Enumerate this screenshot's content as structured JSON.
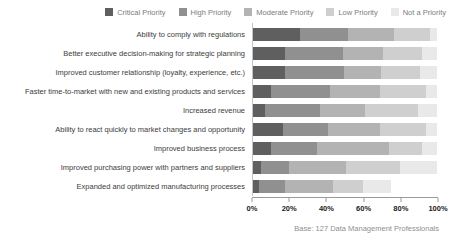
{
  "chart_data": {
    "type": "bar",
    "stacked": true,
    "orientation": "horizontal",
    "unit": "%",
    "categories": [
      "Ability to comply with regulations",
      "Better executive decision-making for strategic planning",
      "Improved customer relationship (loyalty, experience, etc.)",
      "Faster time-to-market with new and existing products and services",
      "Increased revenue",
      "Ability to react quickly to market changes and opportunity",
      "Improved business process",
      "Improved purchasing power with partners and suppliers",
      "Expanded and optimized manufacturing processes"
    ],
    "series": [
      {
        "name": "Critical Priority",
        "color": "#5f5f5f",
        "values": [
          26,
          18,
          18,
          10,
          7,
          17,
          10,
          5,
          4
        ]
      },
      {
        "name": "High Priority",
        "color": "#909090",
        "values": [
          26,
          31,
          32,
          32,
          30,
          24,
          25,
          15,
          14
        ]
      },
      {
        "name": "Moderate Priority",
        "color": "#b3b3b3",
        "values": [
          25,
          22,
          20,
          27,
          24,
          28,
          39,
          31,
          26
        ]
      },
      {
        "name": "Low Priority",
        "color": "#cfcfcf",
        "values": [
          19,
          21,
          21,
          25,
          29,
          25,
          18,
          29,
          16
        ]
      },
      {
        "name": "Not a Priority",
        "color": "#e9e9e9",
        "values": [
          4,
          8,
          9,
          6,
          10,
          6,
          8,
          20,
          15
        ]
      }
    ],
    "x_axis": {
      "min": 0,
      "max": 100,
      "tick_step": 20,
      "ticks": [
        "0%",
        "20%",
        "40%",
        "60%",
        "80%",
        "100%"
      ]
    },
    "legend_position": "top",
    "grid": false,
    "footer": "Base: 127 Data Management Professionals"
  }
}
